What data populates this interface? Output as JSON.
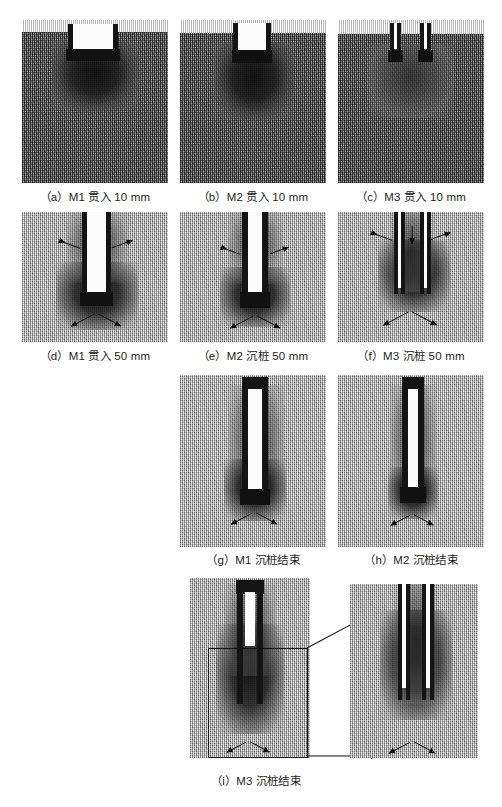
{
  "figure": {
    "type": "dem-simulation-panel-figure",
    "background_color": "#ffffff",
    "caption_color": "#231f20",
    "soil_dark_color": "#6d6d6d",
    "soil_light_color": "#c9c9c9",
    "pile_wall_color": "#141414",
    "pile_core_color": "#fbfbfb",
    "arrow_color": "#0d0d0d"
  },
  "panels": [
    {
      "id": "a",
      "label": "（a）M1 贯入 10 mm",
      "model": "M1",
      "stage": "贯入 10 mm",
      "pile_type": "closed-end single wall",
      "soil": "dense",
      "arrows": 0
    },
    {
      "id": "b",
      "label": "（b）M2 贯入 10 mm",
      "model": "M2",
      "stage": "贯入 10 mm",
      "pile_type": "open-end single wall",
      "soil": "dense",
      "arrows": 0
    },
    {
      "id": "c",
      "label": "（c）M3 贯入 10 mm",
      "model": "M3",
      "stage": "贯入 10 mm",
      "pile_type": "double wall",
      "soil": "dense",
      "arrows": 0
    },
    {
      "id": "d",
      "label": "（d）M1 贯入 50 mm",
      "model": "M1",
      "stage": "贯入 50 mm",
      "pile_type": "closed-end single wall",
      "soil": "light",
      "arrows": 4
    },
    {
      "id": "e",
      "label": "（e）M2 沉桩 50 mm",
      "model": "M2",
      "stage": "沉桩 50 mm",
      "pile_type": "open-end single wall",
      "soil": "light",
      "arrows": 4
    },
    {
      "id": "f",
      "label": "（f）M3 沉桩 50 mm",
      "model": "M3",
      "stage": "沉桩 50 mm",
      "pile_type": "double wall",
      "soil": "light",
      "arrows": 5
    },
    {
      "id": "g",
      "label": "（g）M1 沉桩结束",
      "model": "M1",
      "stage": "沉桩结束",
      "pile_type": "closed-end single wall",
      "soil": "light",
      "arrows": 2
    },
    {
      "id": "h",
      "label": "（h）M2 沉桩结束",
      "model": "M2",
      "stage": "沉桩结束",
      "pile_type": "open-end single wall",
      "soil": "light",
      "arrows": 2
    },
    {
      "id": "i",
      "label": "（i）M3 沉桩结束",
      "model": "M3",
      "stage": "沉桩结束",
      "pile_type": "double wall",
      "soil": "light",
      "arrows": 2,
      "has_detail_callout": true,
      "detail_arrows": 2
    }
  ]
}
